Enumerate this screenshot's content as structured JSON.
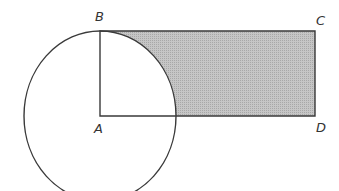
{
  "figure": {
    "labels": {
      "B": "B",
      "C": "C",
      "D": "D",
      "A": "A"
    },
    "colors": {
      "stroke": "#3a3a3a",
      "shade": "#bdbdbd",
      "background": "#ffffff"
    }
  }
}
